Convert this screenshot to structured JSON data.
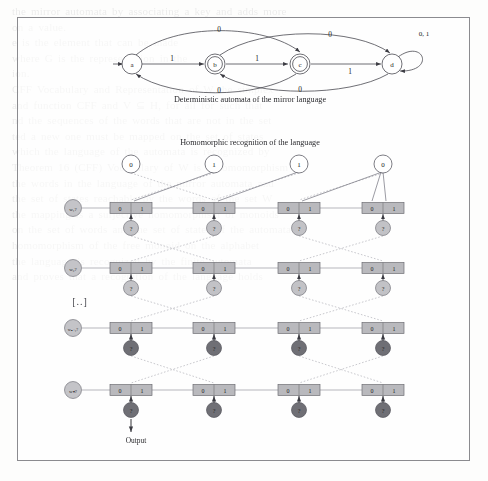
{
  "page": {
    "figure_frame": true,
    "background_color": "#fdfdfc",
    "frame_color": "#8b8b8f"
  },
  "captions": {
    "automata": "Deterministic automata of the mirror language",
    "homomorphic": "Homomorphic recognition of the language",
    "output": "Output",
    "ellipsis": "[..]"
  },
  "automaton": {
    "type": "dfa",
    "states": [
      {
        "id": "a",
        "label": "a",
        "accepting": false,
        "start": true,
        "x": 132,
        "y": 64
      },
      {
        "id": "b",
        "label": "b",
        "accepting": true,
        "start": false,
        "x": 215,
        "y": 64
      },
      {
        "id": "c",
        "label": "c",
        "accepting": true,
        "start": false,
        "x": 300,
        "y": 64
      },
      {
        "id": "d",
        "label": "d",
        "accepting": false,
        "start": false,
        "x": 392,
        "y": 64
      }
    ],
    "transitions": [
      {
        "from": "a",
        "to": "b",
        "label": "1",
        "shape": "straight"
      },
      {
        "from": "b",
        "to": "c",
        "label": "1",
        "shape": "straight"
      },
      {
        "from": "c",
        "to": "d",
        "label": "1",
        "shape": "straight"
      },
      {
        "from": "a",
        "to": "c",
        "label": "0",
        "shape": "arc-above"
      },
      {
        "from": "b",
        "to": "d",
        "label": "0",
        "shape": "arc-above"
      },
      {
        "from": "c",
        "to": "a",
        "label": "0",
        "shape": "arc-below"
      },
      {
        "from": "d",
        "to": "b",
        "label": "0",
        "shape": "arc-below"
      },
      {
        "from": "d",
        "to": "d",
        "label": "0, 1",
        "shape": "self-loop"
      }
    ],
    "self_loop_label": "0, 1",
    "start_arrow": true
  },
  "lattice": {
    "input_tokens": [
      {
        "value": "0",
        "x": 131,
        "y": 164
      },
      {
        "value": "1",
        "x": 214,
        "y": 164
      },
      {
        "value": "1",
        "x": 299,
        "y": 164
      },
      {
        "value": "0",
        "x": 383,
        "y": 164
      }
    ],
    "row_labels": [
      "w₁?",
      "w₂?",
      "wₙ₋₁?",
      "wₙ?"
    ],
    "rows": [
      {
        "index": 0,
        "y": 208,
        "node_y": 228,
        "node_kind": "question",
        "node_text": "?"
      },
      {
        "index": 1,
        "y": 268,
        "node_y": 288,
        "node_kind": "question",
        "node_text": "?"
      },
      {
        "index": 2,
        "y": 328,
        "node_y": 348,
        "node_kind": "filled",
        "node_text": "?"
      },
      {
        "index": 3,
        "y": 390,
        "node_y": 410,
        "node_kind": "filled",
        "node_text": "?"
      }
    ],
    "cell_labels": [
      "0",
      "1"
    ],
    "columns_x": [
      131,
      214,
      299,
      383
    ],
    "box_width": 42,
    "box_height": 11,
    "colors": {
      "box_fill": "#b9b9bd",
      "box_stroke": "#6e6e74",
      "node_light": "#c2c2c6",
      "node_dark": "#6f6f75",
      "edge": "#8e8e96",
      "dotted_edge": "#a9a9b1"
    }
  },
  "bleed_text": [
    "the mirror automata by associating a key and adds more",
    "on a value.",
    "e is the element that can be made",
    "where G is the representation in the",
    "ion.",
    "CFF Vocabulary and Representation of W the simplex",
    "and function CFF and V ⊆ H, for all for such that",
    "nd the sequences of the words that are not in the set",
    "ted a new one must be mapped on the set of states",
    "which the language of the automata is recognized by",
    "Theorem 16 (CFF) Vocabulary of W is a homomorphism of",
    "the words in the language of the mirror automata and",
    "the set of states reachable by the words of the set W",
    "the mapping is a surjective homomorphism of monoids",
    "on the set of words and the set of states of the automata",
    "homomorphism of the free monoid on the alphabet",
    "the language is recognized by the finite automata",
    "and proves that a recognition of the language holds"
  ]
}
